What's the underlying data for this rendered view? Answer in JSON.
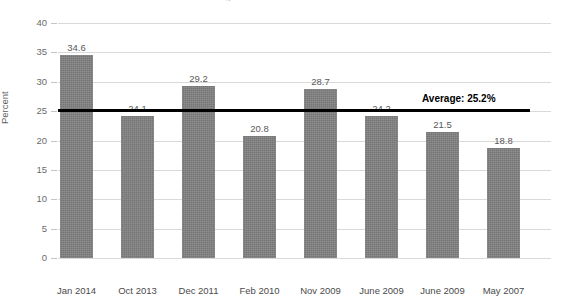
{
  "chart_data": {
    "type": "bar",
    "title": "Significant Difference Over Time",
    "xlabel": "",
    "ylabel": "Percent",
    "ylim": [
      0,
      40
    ],
    "ytick_step": 5,
    "yticks": [
      "40",
      "35",
      "30",
      "25",
      "20",
      "15",
      "10",
      "5",
      "0"
    ],
    "grid": true,
    "legend": "none",
    "categories": [
      "Jan 2014",
      "Oct 2013",
      "Dec 2011",
      "Feb 2010",
      "Nov 2009",
      "June 2009",
      "June 2009",
      "May 2007"
    ],
    "values": [
      34.6,
      24.1,
      29.2,
      20.8,
      28.7,
      24.2,
      21.5,
      18.8
    ],
    "value_labels": [
      "34.6",
      "24.1",
      "29.2",
      "20.8",
      "28.7",
      "24.2",
      "21.5",
      "18.8"
    ],
    "bar_color": "#808080",
    "gridline_color": "#d9d9d9",
    "annotations": [
      {
        "name": "average-line",
        "label": "Average: 25.2%",
        "value": 25.2,
        "color": "#000000"
      }
    ]
  }
}
